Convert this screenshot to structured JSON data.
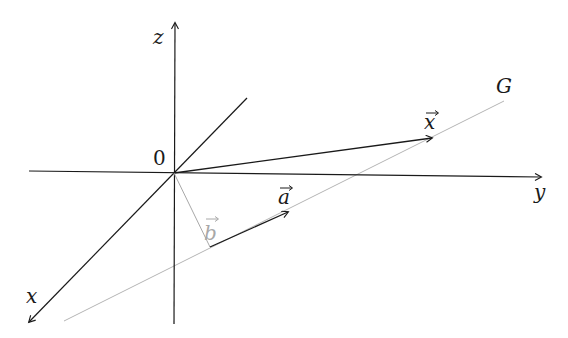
{
  "diagram": {
    "axes": {
      "z_label": "z",
      "y_label": "y",
      "x_label": "x",
      "origin_label": "0"
    },
    "line": {
      "label": "G",
      "color": "#b0b0b0"
    },
    "vectors": {
      "x_label": "x",
      "a_label": "a",
      "b_label": "b",
      "vector_arrow": "⃗"
    },
    "colors": {
      "axis": "#1a1a1a",
      "vector": "#2a2a2a",
      "secondary": "#a8a8a8"
    }
  }
}
